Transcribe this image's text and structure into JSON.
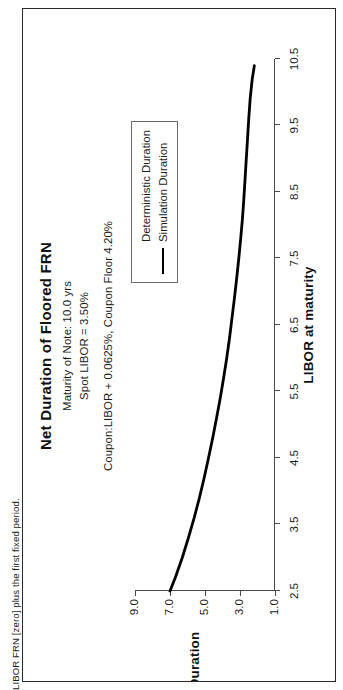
{
  "figure": {
    "caption": "LIBOR FRN [zero] plus the first fixed period."
  },
  "chart_data": {
    "type": "line",
    "title": "Net Duration of Floored FRN",
    "subtitles": [
      "Maturity of Note: 10.0 yrs",
      "Spot LIBOR = 3.50%",
      "Coupon:LIBOR + 0.0625%, Coupon Floor 4.20%"
    ],
    "xlabel": "LIBOR at maturity",
    "ylabel": "Duration",
    "xlim": [
      2.5,
      10.5
    ],
    "ylim": [
      1.0,
      9.0
    ],
    "xticks": [
      2.5,
      3.5,
      4.5,
      5.5,
      6.5,
      7.5,
      8.5,
      9.5,
      10.5
    ],
    "xtick_labels": [
      "2.5",
      "3.5",
      "4.5",
      "5.5",
      "6.5",
      "7.5",
      "8.5",
      "9.5",
      "10.5"
    ],
    "yticks": [
      1.0,
      3.0,
      5.0,
      7.0,
      9.0
    ],
    "ytick_labels": [
      "1.0",
      "3.0",
      "5.0",
      "7.0",
      "9.0"
    ],
    "grid": false,
    "legend_position": "upper right",
    "legend": [
      {
        "name": "Deterministic Duration",
        "style": "none"
      },
      {
        "name": "Simulation Duration",
        "style": "solid-black"
      }
    ],
    "series": [
      {
        "name": "Simulation Duration",
        "style": "solid-black",
        "x": [
          2.5,
          2.7,
          3.0,
          3.3,
          3.6,
          3.9,
          4.2,
          4.5,
          4.8,
          5.1,
          5.4,
          5.7,
          6.0,
          6.3,
          6.6,
          6.9,
          7.2,
          7.5,
          7.8,
          8.1,
          8.4,
          8.7,
          9.0,
          9.3,
          9.6,
          9.9,
          10.2,
          10.4
        ],
        "y": [
          7.0,
          6.7,
          6.3,
          5.95,
          5.62,
          5.32,
          5.05,
          4.8,
          4.56,
          4.34,
          4.13,
          3.94,
          3.76,
          3.6,
          3.46,
          3.32,
          3.19,
          3.07,
          2.96,
          2.86,
          2.78,
          2.71,
          2.64,
          2.57,
          2.5,
          2.42,
          2.3,
          2.18
        ]
      }
    ]
  }
}
